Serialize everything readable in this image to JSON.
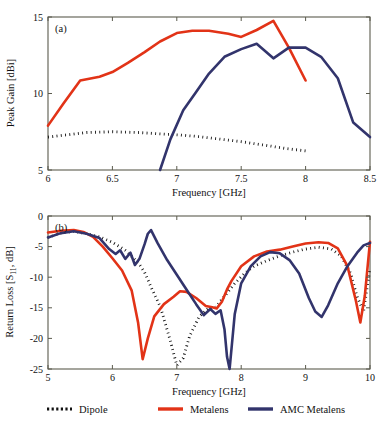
{
  "figure": {
    "background": "#ffffff",
    "colors": {
      "dipole": "#111111",
      "metalens": "#e23317",
      "amc_metalens": "#32346c",
      "axis": "#5b5b4e"
    }
  },
  "legend": {
    "position": "bottom-center",
    "entries": [
      {
        "label": "Dipole",
        "style": "dotted",
        "color": "#111111"
      },
      {
        "label": "Metalens",
        "style": "solid",
        "color": "#e23317"
      },
      {
        "label": "AMC Metalens",
        "style": "solid",
        "color": "#32346c"
      }
    ]
  },
  "chart_data": [
    {
      "type": "line",
      "panel": "(a)",
      "title": "",
      "xlabel": "Frequency [GHz]",
      "ylabel": "Peak Gain [dBi]",
      "xlim": [
        6,
        8.5
      ],
      "ylim": [
        5,
        15
      ],
      "xticks": [
        6,
        6.5,
        7,
        7.5,
        8,
        8.5
      ],
      "xticklabels": [
        "6",
        "6.5",
        "7",
        "7.5",
        "8",
        "8.5"
      ],
      "yticks": [
        5,
        10,
        15
      ],
      "yticklabels": [
        "5",
        "10",
        "15"
      ],
      "grid": false,
      "legend": [
        "Dipole",
        "Metalens",
        "AMC Metalens"
      ],
      "series": [
        {
          "name": "Dipole",
          "style": "dotted",
          "color": "#111111",
          "x": [
            6.0,
            6.15,
            6.3,
            6.5,
            6.7,
            6.9,
            7.0,
            7.15,
            7.3,
            7.5,
            7.7,
            7.85,
            8.0
          ],
          "values": [
            7.15,
            7.3,
            7.45,
            7.5,
            7.45,
            7.35,
            7.3,
            7.2,
            7.05,
            6.85,
            6.6,
            6.4,
            6.25
          ]
        },
        {
          "name": "Metalens",
          "style": "solid",
          "color": "#e23317",
          "x": [
            6.0,
            6.12,
            6.25,
            6.4,
            6.5,
            6.62,
            6.75,
            6.87,
            7.0,
            7.12,
            7.25,
            7.4,
            7.5,
            7.62,
            7.75,
            7.87,
            8.0
          ],
          "values": [
            7.9,
            9.35,
            10.85,
            11.1,
            11.4,
            12.0,
            12.7,
            13.4,
            13.95,
            14.1,
            14.1,
            13.9,
            13.7,
            14.15,
            14.75,
            13.0,
            10.85
          ]
        },
        {
          "name": "AMC Metalens",
          "style": "solid",
          "color": "#32346c",
          "x": [
            6.87,
            6.95,
            7.05,
            7.15,
            7.25,
            7.37,
            7.5,
            7.62,
            7.75,
            7.87,
            8.0,
            8.12,
            8.25,
            8.37,
            8.5
          ],
          "values": [
            5.0,
            7.0,
            8.9,
            10.1,
            11.3,
            12.4,
            12.9,
            13.25,
            12.3,
            13.0,
            13.0,
            12.4,
            11.0,
            8.1,
            7.15
          ]
        }
      ]
    },
    {
      "type": "line",
      "panel": "(b)",
      "title": "",
      "xlabel": "Frequency [GHz]",
      "ylabel": "Return Loss [S11, dB]",
      "xlim": [
        5,
        10
      ],
      "ylim": [
        -25,
        0
      ],
      "xticks": [
        5,
        6,
        7,
        8,
        9,
        10
      ],
      "xticklabels": [
        "5",
        "6",
        "7",
        "8",
        "9",
        "10"
      ],
      "yticks": [
        0,
        -5,
        -10,
        -15,
        -20,
        -25
      ],
      "yticklabels": [
        "0",
        "-5",
        "-10",
        "-15",
        "-20",
        "-25"
      ],
      "grid": false,
      "legend": [
        "Dipole",
        "Metalens",
        "AMC Metalens"
      ],
      "series": [
        {
          "name": "Dipole",
          "style": "dotted",
          "color": "#111111",
          "x": [
            5.0,
            5.2,
            5.4,
            5.6,
            5.8,
            6.0,
            6.2,
            6.4,
            6.5,
            6.6,
            6.75,
            6.9,
            7.0,
            7.1,
            7.2,
            7.35,
            7.5,
            7.6,
            7.75,
            7.9,
            8.05,
            8.2,
            8.4,
            8.6,
            8.8,
            9.0,
            9.2,
            9.4,
            9.55,
            9.7,
            9.8,
            9.9,
            10.0
          ],
          "values": [
            -3.5,
            -2.8,
            -2.5,
            -2.9,
            -3.4,
            -4.3,
            -5.6,
            -7.6,
            -9.2,
            -11.6,
            -15.0,
            -20.4,
            -24.4,
            -23.2,
            -19.6,
            -16.4,
            -15.0,
            -14.9,
            -13.0,
            -11.0,
            -9.4,
            -8.2,
            -7.3,
            -6.5,
            -5.9,
            -5.4,
            -5.1,
            -5.4,
            -6.5,
            -9.4,
            -13.2,
            -15.6,
            -8.6
          ]
        },
        {
          "name": "Metalens",
          "style": "solid",
          "color": "#e23317",
          "x": [
            5.0,
            5.2,
            5.4,
            5.55,
            5.7,
            5.85,
            6.0,
            6.15,
            6.3,
            6.4,
            6.47,
            6.55,
            6.65,
            6.8,
            6.95,
            7.05,
            7.15,
            7.3,
            7.45,
            7.55,
            7.62,
            7.7,
            7.78,
            7.85,
            8.0,
            8.2,
            8.4,
            8.6,
            8.8,
            9.0,
            9.2,
            9.35,
            9.5,
            9.65,
            9.78,
            9.85,
            9.92,
            10.0
          ],
          "values": [
            -2.7,
            -2.4,
            -2.3,
            -2.6,
            -3.4,
            -5.0,
            -6.9,
            -8.9,
            -12.2,
            -17.5,
            -23.4,
            -20.0,
            -16.4,
            -14.4,
            -13.2,
            -12.3,
            -12.4,
            -13.4,
            -14.7,
            -14.9,
            -15.1,
            -14.0,
            -12.0,
            -10.6,
            -8.2,
            -6.6,
            -5.8,
            -5.5,
            -5.0,
            -4.5,
            -4.3,
            -4.4,
            -5.3,
            -8.2,
            -13.8,
            -17.4,
            -13.0,
            -4.2
          ]
        },
        {
          "name": "AMC Metalens",
          "style": "solid",
          "color": "#32346c",
          "x": [
            5.0,
            5.2,
            5.4,
            5.6,
            5.8,
            5.95,
            6.05,
            6.12,
            6.2,
            6.28,
            6.35,
            6.42,
            6.5,
            6.55,
            6.6,
            6.7,
            6.85,
            7.0,
            7.15,
            7.3,
            7.42,
            7.52,
            7.6,
            7.68,
            7.74,
            7.78,
            7.82,
            7.9,
            8.0,
            8.15,
            8.3,
            8.45,
            8.6,
            8.75,
            8.9,
            9.05,
            9.15,
            9.25,
            9.35,
            9.5,
            9.65,
            9.8,
            9.9,
            10.0
          ],
          "values": [
            -3.5,
            -2.8,
            -2.5,
            -2.9,
            -3.6,
            -5.4,
            -6.2,
            -5.6,
            -7.0,
            -6.0,
            -8.0,
            -7.0,
            -4.6,
            -2.9,
            -2.3,
            -4.4,
            -7.2,
            -9.6,
            -12.0,
            -14.4,
            -16.2,
            -15.2,
            -16.0,
            -15.4,
            -18.5,
            -23.0,
            -25.0,
            -16.0,
            -11.0,
            -8.2,
            -6.6,
            -5.9,
            -6.1,
            -7.2,
            -9.4,
            -13.4,
            -15.6,
            -16.5,
            -14.6,
            -11.0,
            -8.2,
            -6.0,
            -4.8,
            -4.4
          ]
        }
      ]
    }
  ]
}
